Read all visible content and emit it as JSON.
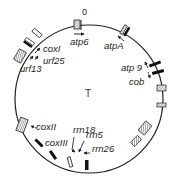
{
  "diagram": {
    "type": "circular-genome-map",
    "center_label": "T",
    "origin_label": "0",
    "genes": [
      {
        "name": "atp6",
        "label": "atp6"
      },
      {
        "name": "atpA",
        "label": "atpA"
      },
      {
        "name": "atp9",
        "label": "atp 9"
      },
      {
        "name": "cob",
        "label": "cob"
      },
      {
        "name": "coxI",
        "label": "coxI"
      },
      {
        "name": "urf25",
        "label": "urf25"
      },
      {
        "name": "urf13",
        "label": "urf13"
      },
      {
        "name": "coxII",
        "label": "coxII"
      },
      {
        "name": "coxIII",
        "label": "coxIII"
      },
      {
        "name": "rrn18",
        "label": "rrn18"
      },
      {
        "name": "rrn5",
        "label": "rrn5"
      },
      {
        "name": "rrn26",
        "label": "rrn26"
      }
    ],
    "colors": {
      "line": "#222222",
      "hatch": "#555555",
      "background": "#ffffff"
    }
  }
}
